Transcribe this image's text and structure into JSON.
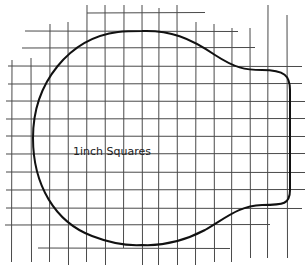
{
  "diagram": {
    "type": "sewing-pattern-template",
    "grid_unit_label": "1inch Squares",
    "line_color": "#4a4a4a",
    "outline_color": "#111111",
    "background": "#ffffff",
    "shape_description": "Rounded pattern piece: large circular left section joined to a narrower rectangular tab on the right with rounded corners"
  }
}
